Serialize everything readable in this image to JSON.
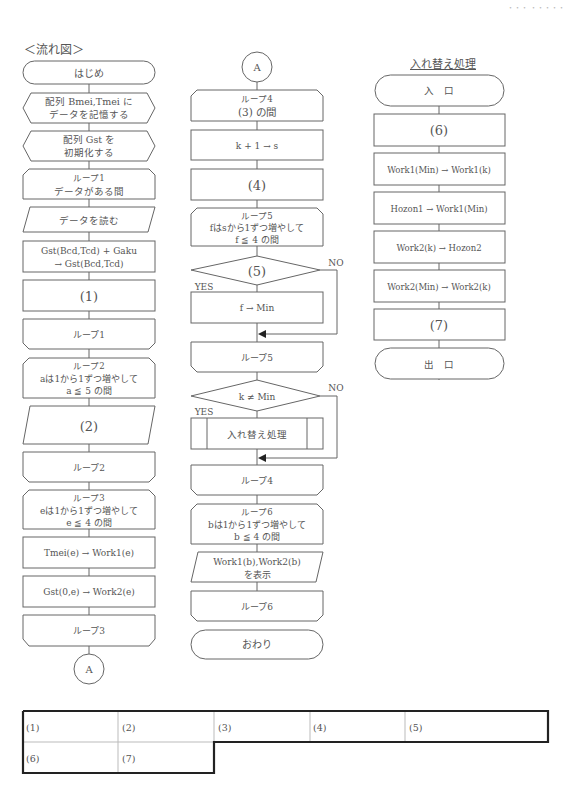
{
  "page": {
    "header_mark": "・・・ ・・・・・",
    "section_label": "＜流れ図＞",
    "subroutine_title": "入れ替え処理"
  },
  "main_flow": {
    "start": "はじめ",
    "store_data": [
      "配列 Bmei,Tmei に",
      "データを記憶する"
    ],
    "init_gst": [
      "配列 Gst を",
      "初期化する"
    ],
    "loop1_start": [
      "ループ1",
      "データがある間"
    ],
    "read_data": "データを読む",
    "accumulate": [
      "Gst(Bcd,Tcd) + Gaku",
      "→ Gst(Bcd,Tcd)"
    ],
    "blank1": "(1)",
    "loop1_end": "ループ1",
    "loop2_start": [
      "ループ2",
      "aは1から1ずつ増やして",
      "a ≦ 5 の間"
    ],
    "blank2": "(2)",
    "loop2_end": "ループ2",
    "loop3_start": [
      "ループ3",
      "eは1から1ずつ増やして",
      "e ≦ 4 の間"
    ],
    "assign_work1": "Tmei(e) → Work1(e)",
    "assign_work2": "Gst(0,e) → Work2(e)",
    "loop3_end": "ループ3",
    "connector_out": "A"
  },
  "middle_flow": {
    "connector_in": "A",
    "loop4_start": [
      "ループ4",
      "(3)  の間"
    ],
    "k_plus": "k + 1 → s",
    "blank4": "(4)",
    "loop5_start": [
      "ループ5",
      "fはsから1ずつ増やして",
      "f ≦ 4 の間"
    ],
    "decision5": "(5)",
    "decision5_yes": "YES",
    "decision5_no": "NO",
    "f_to_min": "f → Min",
    "loop5_end": "ループ5",
    "decision_k": "k ≠ Min",
    "decision_k_yes": "YES",
    "decision_k_no": "NO",
    "swap_call": "入れ替え処理",
    "loop4_end": "ループ4",
    "loop6_start": [
      "ループ6",
      "bは1から1ずつ増やして",
      "b ≦ 4 の間"
    ],
    "display": [
      "Work1(b),Work2(b)",
      "を表示"
    ],
    "loop6_end": "ループ6",
    "end": "おわり"
  },
  "swap_flow": {
    "entry": "入　口",
    "blank6": "(6)",
    "step1": "Work1(Min) → Work1(k)",
    "step2": "Hozon1 → Work1(Min)",
    "step3": "Work2(k) → Hozon2",
    "step4": "Work2(Min) → Work2(k)",
    "blank7": "(7)",
    "exit": "出　口"
  },
  "answer_table": {
    "row1": [
      "(1)",
      "(2)",
      "(3)",
      "(4)",
      "(5)"
    ],
    "row2": [
      "(6)",
      "(7)"
    ]
  }
}
